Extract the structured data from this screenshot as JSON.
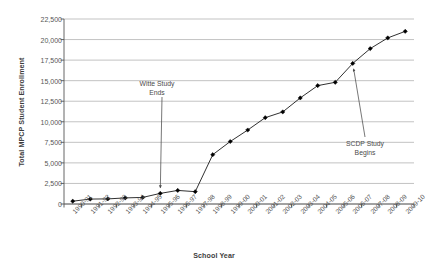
{
  "chart_data": {
    "type": "line",
    "title": "",
    "xlabel": "School Year",
    "ylabel": "Total MPCP Student Enrollment",
    "categories": [
      "1990-91",
      "1991-92",
      "1992-93",
      "1993-94",
      "1994-95",
      "1995-96",
      "1996-97",
      "1997-98",
      "1998-99",
      "1999-00",
      "2000-01",
      "2001-02",
      "2002-03",
      "2003-04",
      "2004-05",
      "2005-06",
      "2006-07",
      "2007-08",
      "2008-09",
      "2009-10"
    ],
    "values": [
      341,
      600,
      620,
      740,
      800,
      1290,
      1650,
      1500,
      6000,
      7600,
      9000,
      10500,
      11200,
      12900,
      14400,
      14800,
      17100,
      18900,
      20200,
      21000
    ],
    "series": [
      {
        "name": "Total MPCP Student Enrollment",
        "values": [
          341,
          600,
          620,
          740,
          800,
          1290,
          1650,
          1500,
          6000,
          7600,
          9000,
          10500,
          11200,
          12900,
          14400,
          14800,
          17100,
          18900,
          20200,
          21000
        ]
      }
    ],
    "ylim": [
      0,
      22500
    ],
    "y_ticks": [
      0,
      2500,
      5000,
      7500,
      10000,
      12500,
      15000,
      17500,
      20000,
      22500
    ],
    "y_tick_labels": [
      "0",
      "2,500",
      "5,000",
      "7,500",
      "10,000",
      "12,500",
      "15,000",
      "17,500",
      "20,000",
      "22,500"
    ],
    "grid": true,
    "legend": "none",
    "line_color": "#1a1a1a",
    "marker": "diamond",
    "marker_color": "#000000",
    "annotations": [
      {
        "id": "witte-study-ends",
        "text_lines": [
          "Witte Study",
          "Ends"
        ],
        "target_category": "1995-96",
        "target_value": 1290
      },
      {
        "id": "scdp-study-begins",
        "text_lines": [
          "SCDP Study",
          "Begins"
        ],
        "target_category": "2006-07",
        "target_value": 17100
      }
    ]
  }
}
